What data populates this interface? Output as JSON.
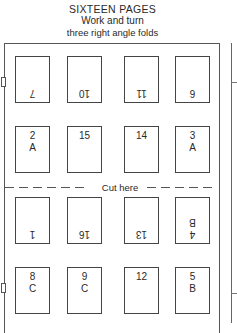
{
  "header": {
    "title": "SIXTEEN PAGES",
    "subtitle": "Work and turn",
    "caption": "three right angle folds"
  },
  "cut_line": {
    "label": "Cut here"
  },
  "rows": [
    {
      "orientation": "upside-down",
      "pages": [
        {
          "number": "7",
          "letter": ""
        },
        {
          "number": "10",
          "letter": ""
        },
        {
          "number": "11",
          "letter": ""
        },
        {
          "number": "6",
          "letter": ""
        }
      ]
    },
    {
      "orientation": "upright",
      "pages": [
        {
          "number": "2",
          "letter": "A"
        },
        {
          "number": "15",
          "letter": ""
        },
        {
          "number": "14",
          "letter": ""
        },
        {
          "number": "3",
          "letter": "A"
        }
      ]
    },
    {
      "orientation": "upside-down",
      "pages": [
        {
          "number": "1",
          "letter": ""
        },
        {
          "number": "16",
          "letter": ""
        },
        {
          "number": "13",
          "letter": ""
        },
        {
          "number": "4",
          "letter": "B"
        }
      ]
    },
    {
      "orientation": "upright",
      "pages": [
        {
          "number": "8",
          "letter": "C"
        },
        {
          "number": "9",
          "letter": "C"
        },
        {
          "number": "12",
          "letter": ""
        },
        {
          "number": "5",
          "letter": "B"
        }
      ]
    }
  ],
  "colors": {
    "line": "#444444",
    "text": "#2a2a2a",
    "background": "#ffffff"
  }
}
